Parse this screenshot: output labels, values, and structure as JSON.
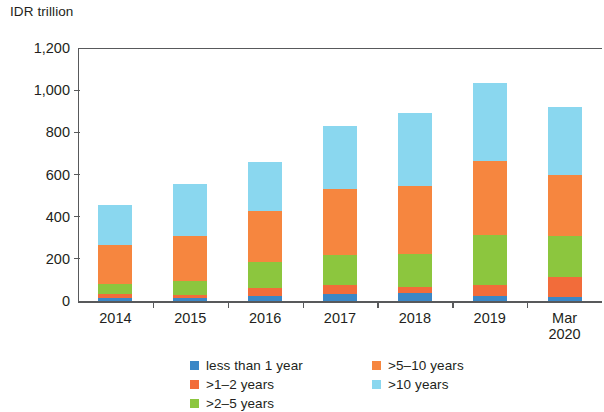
{
  "chart_data": {
    "type": "bar",
    "subtype": "stacked-bar",
    "title": "",
    "subtitle": "",
    "xlabel": "",
    "ylabel": "IDR trillion",
    "unit_caption": "IDR trillion",
    "categories": [
      "2014",
      "2015",
      "2016",
      "2017",
      "2018",
      "2019",
      "Mar\n2020"
    ],
    "category_labels_flat": [
      "2014",
      "2015",
      "2016",
      "2017",
      "2018",
      "2019",
      "Mar 2020"
    ],
    "ylim": [
      0,
      1200
    ],
    "yticks": [
      0,
      200,
      400,
      600,
      800,
      1000,
      1200
    ],
    "ytick_labels": [
      "0",
      "200",
      "400",
      "600",
      "800",
      "1,000",
      "1,200"
    ],
    "grid": false,
    "legend_position": "bottom",
    "stack_order": [
      "less than 1 year",
      ">1–2 years",
      ">2–5 years",
      ">5–10 years",
      ">10 years"
    ],
    "series": [
      {
        "name": "less than 1 year",
        "color": "#3b87c6",
        "values": [
          15,
          15,
          25,
          35,
          40,
          25,
          20
        ]
      },
      {
        "name": ">1–2 years",
        "color": "#f26c3a",
        "values": [
          20,
          15,
          35,
          40,
          25,
          50,
          95
        ]
      },
      {
        "name": ">2–5 years",
        "color": "#8cc63e",
        "values": [
          45,
          65,
          125,
          145,
          160,
          240,
          195
        ]
      },
      {
        "name": ">5–10 years",
        "color": "#f6863f",
        "values": [
          185,
          215,
          240,
          310,
          320,
          350,
          290
        ]
      },
      {
        "name": ">10 years",
        "color": "#8ad7ef",
        "values": [
          190,
          245,
          235,
          300,
          345,
          370,
          320
        ]
      }
    ],
    "totals": [
      455,
      555,
      660,
      830,
      890,
      1035,
      920
    ]
  },
  "legend": {
    "entries": [
      {
        "label": "less than 1 year",
        "color": "#3b87c6",
        "column": 0,
        "row": 0
      },
      {
        "label": ">1–2 years",
        "color": "#f26c3a",
        "column": 0,
        "row": 1
      },
      {
        "label": ">2–5 years",
        "color": "#8cc63e",
        "column": 0,
        "row": 2
      },
      {
        "label": ">5–10 years",
        "color": "#f6863f",
        "column": 1,
        "row": 0
      },
      {
        "label": ">10 years",
        "color": "#8ad7ef",
        "column": 1,
        "row": 1
      }
    ]
  },
  "style": {
    "axis_color": "#58595b",
    "text_color": "#231f20",
    "background": "#ffffff"
  }
}
